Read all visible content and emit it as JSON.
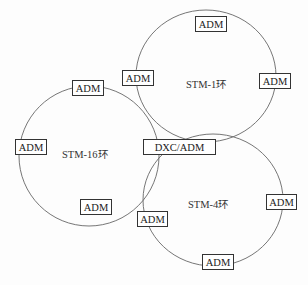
{
  "diagram": {
    "rings": [
      {
        "id": "stm1",
        "label": "STM-1环"
      },
      {
        "id": "stm16",
        "label": "STM-16环"
      },
      {
        "id": "stm4",
        "label": "STM-4环"
      }
    ],
    "hub": {
      "label": "DXC/ADM"
    },
    "nodes": {
      "stm1_top": "ADM",
      "stm1_left": "ADM",
      "stm1_right": "ADM",
      "stm16_top": "ADM",
      "stm16_left": "ADM",
      "stm16_bottom": "ADM",
      "stm4_left": "ADM",
      "stm4_right": "ADM",
      "stm4_bottom": "ADM"
    }
  }
}
